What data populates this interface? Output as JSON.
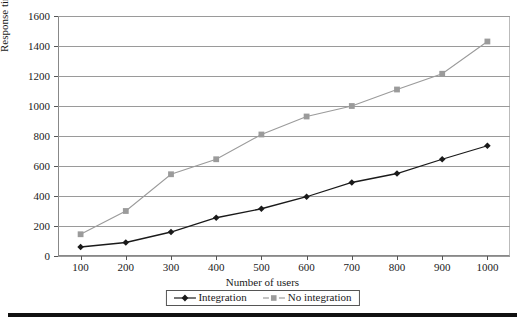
{
  "chart_data": {
    "type": "line",
    "title": "",
    "xlabel": "Number of users",
    "ylabel": "Response time (ms)",
    "categories": [
      100,
      200,
      300,
      400,
      500,
      600,
      700,
      800,
      900,
      1000
    ],
    "x": [
      100,
      200,
      300,
      400,
      500,
      600,
      700,
      800,
      900,
      1000
    ],
    "xlim": [
      50,
      1050
    ],
    "ylim": [
      0,
      1600
    ],
    "ytick_labels": [
      "0",
      "200",
      "400",
      "600",
      "800",
      "1000",
      "1200",
      "1400",
      "1600"
    ],
    "yticks": [
      0,
      200,
      400,
      600,
      800,
      1000,
      1200,
      1400,
      1600
    ],
    "xtick_labels": [
      "100",
      "200",
      "300",
      "400",
      "500",
      "600",
      "700",
      "800",
      "900",
      "1000"
    ],
    "grid": "horizontal",
    "legend_position": "bottom",
    "series": [
      {
        "name": "Integration",
        "color": "#1a1a1a",
        "marker": "diamond",
        "values": [
          60,
          90,
          160,
          255,
          315,
          395,
          490,
          550,
          645,
          735
        ]
      },
      {
        "name": "No integration",
        "color": "#9b9b9b",
        "marker": "square",
        "values": [
          145,
          300,
          545,
          645,
          810,
          930,
          1000,
          1110,
          1215,
          1430
        ]
      }
    ]
  },
  "legend": {
    "entries": [
      {
        "label": "Integration"
      },
      {
        "label": "No integration"
      }
    ]
  },
  "colors": {
    "integration": "#1a1a1a",
    "no_integration": "#9b9b9b",
    "gridline": "#9a9a9a",
    "axis": "#555555",
    "rule": "#111111"
  }
}
